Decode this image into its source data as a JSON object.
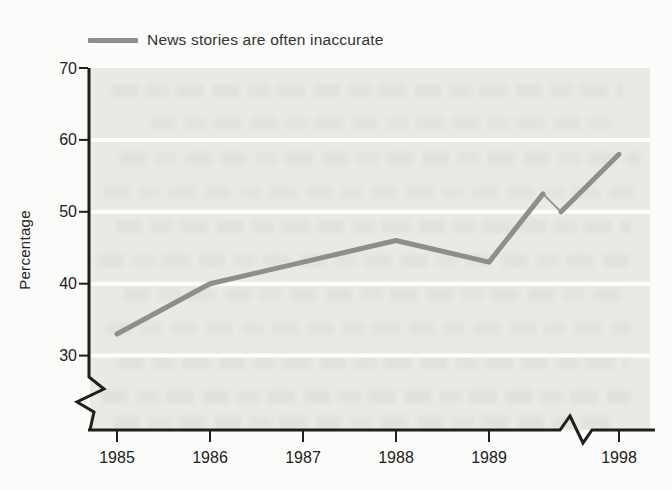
{
  "chart_data": {
    "type": "line",
    "title": "",
    "legend_label": "News stories are often inaccurate",
    "legend_position": "top-left",
    "categories": [
      "1985",
      "1986",
      "1987",
      "1988",
      "1989",
      "1998"
    ],
    "series": [
      {
        "name": "News stories are often inaccurate",
        "values": [
          33,
          40,
          43,
          46,
          43,
          58
        ]
      }
    ],
    "xlabel": "",
    "ylabel": "Percentage",
    "yticks": [
      70,
      60,
      50,
      40,
      30
    ],
    "ylim_shown": [
      30,
      70
    ],
    "grid": "horizontal white gridlines on shaded panel",
    "axis_breaks": {
      "y_axis": "break mark below the 30 tick",
      "x_axis": "break mark between 1989 and 1998",
      "line_break_exit_value": 52.5,
      "line_break_resume_value": 50
    },
    "colors": {
      "line": "#8e8e8c",
      "plot_background": "#e9e9e6",
      "gridline": "#fcfcfb",
      "axis": "#1e1e1c",
      "page_background": "#fbfbf9"
    }
  }
}
